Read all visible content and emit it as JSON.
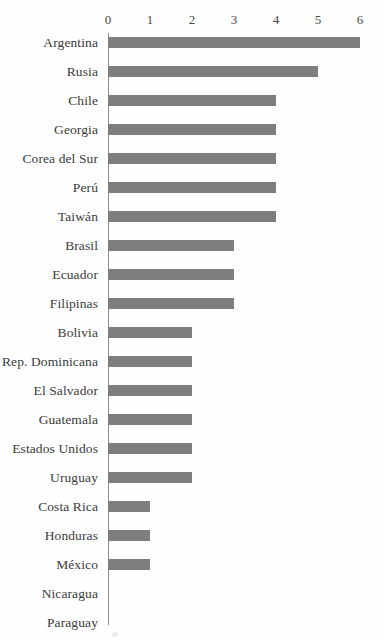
{
  "chart_data": {
    "type": "bar",
    "orientation": "horizontal",
    "title": "",
    "subtitle": "",
    "xlabel": "",
    "ylabel": "",
    "xlim": [
      0,
      6
    ],
    "xticks": [
      0,
      1,
      2,
      3,
      4,
      5,
      6
    ],
    "xtick_labels": [
      "0",
      "1",
      "2",
      "3",
      "4",
      "5",
      "6"
    ],
    "axis_position": "top",
    "grid": false,
    "legend": false,
    "bar_color": "#7e7e7e",
    "axis_color": "#8d8d8d",
    "text_color": "#3b3b3b",
    "categories": [
      "Argentina",
      "Rusia",
      "Chile",
      "Georgia",
      "Corea del Sur",
      "Perú",
      "Taiwán",
      "Brasil",
      "Ecuador",
      "Filipinas",
      "Bolivia",
      "Rep. Dominicana",
      "El Salvador",
      "Guatemala",
      "Estados Unidos",
      "Uruguay",
      "Costa Rica",
      "Honduras",
      "México",
      "Nicaragua",
      "Paraguay"
    ],
    "values": [
      6,
      5,
      4,
      4,
      4,
      4,
      4,
      3,
      3,
      3,
      2,
      2,
      2,
      2,
      2,
      2,
      1,
      1,
      1,
      0,
      0
    ]
  }
}
